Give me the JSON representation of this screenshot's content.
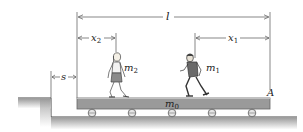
{
  "diagram": {
    "type": "mechanics-figure",
    "labels": {
      "length": "l",
      "x1": "x",
      "x1_sub": "1",
      "x2": "x",
      "x2_sub": "2",
      "s": "s",
      "m1": "m",
      "m1_sub": "1",
      "m2": "m",
      "m2_sub": "2",
      "m0": "m",
      "m0_sub": "0",
      "point_A": "A"
    },
    "elements": {
      "platform": "flatcar m0 of length l",
      "wheels_count": 5,
      "person_1": "man (m1) running",
      "person_2": "woman (m2) walking",
      "ground": "stepped ground with gap s"
    },
    "colors": {
      "line": "#555555",
      "platform_fill": "#9a9a9a",
      "platform_stroke": "#6a6a6a",
      "ground_shade": "#bdbdbd"
    }
  }
}
